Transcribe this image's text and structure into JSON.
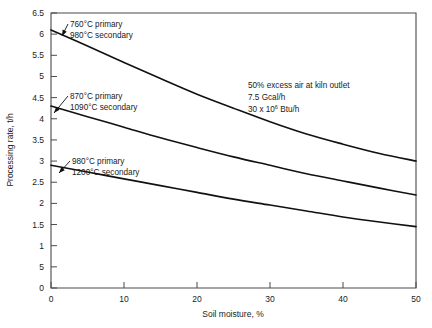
{
  "chart_data": {
    "type": "line",
    "title": "",
    "xlabel": "Soil moisture, %",
    "ylabel": "Processing rate, t/h",
    "xlim": [
      0,
      50
    ],
    "ylim": [
      0,
      6.5
    ],
    "grid": false,
    "legend_position": "inline-annotations",
    "xticks": [
      0,
      10,
      20,
      30,
      40,
      50
    ],
    "xtick_labels": [
      "0",
      "10",
      "20",
      "30",
      "40",
      "50"
    ],
    "yticks": [
      0,
      0.5,
      1,
      1.5,
      2,
      2.5,
      3,
      3.5,
      4,
      4.5,
      5,
      5.5,
      6,
      6.5
    ],
    "ytick_labels": [
      "0",
      "5",
      "1",
      "1.5",
      "2",
      "2.5",
      "3",
      "3.5",
      "4",
      "4.5",
      "5",
      "5.5",
      "6",
      "6.5"
    ],
    "x": [
      0,
      5,
      10,
      15,
      20,
      25,
      30,
      35,
      40,
      45,
      50
    ],
    "series": [
      {
        "name": "760°C primary / 980°C secondary",
        "values": [
          6.1,
          5.72,
          5.33,
          4.95,
          4.58,
          4.25,
          3.93,
          3.64,
          3.4,
          3.18,
          3.0
        ]
      },
      {
        "name": "870°C primary / 1090°C secondary",
        "values": [
          4.3,
          4.05,
          3.8,
          3.55,
          3.32,
          3.1,
          2.9,
          2.7,
          2.53,
          2.36,
          2.2
        ]
      },
      {
        "name": "980°C primary / 1200°C secondary",
        "values": [
          2.9,
          2.74,
          2.58,
          2.42,
          2.26,
          2.1,
          1.96,
          1.82,
          1.68,
          1.56,
          1.45
        ]
      }
    ],
    "annotations": [
      {
        "name": "curve-label-top",
        "line1": "760°C  primary",
        "line2": "980°C  secondary",
        "text_x": 70,
        "text_y": 27,
        "leader_from_x": 68,
        "leader_from_y": 24,
        "point_x": 62,
        "point_y": 36
      },
      {
        "name": "curve-label-middle",
        "line1": "870°C  primary",
        "line2": "1090°C  secondary",
        "text_x": 70,
        "text_y": 99,
        "leader_from_x": 68,
        "leader_from_y": 96,
        "point_x": 54,
        "point_y": 113
      },
      {
        "name": "curve-label-bottom",
        "line1": "980°C  primary",
        "line2": "1200°C  secondary",
        "text_x": 72,
        "text_y": 164,
        "leader_from_x": 70,
        "leader_from_y": 161,
        "point_x": 59,
        "point_y": 173
      }
    ],
    "note_block": {
      "name": "conditions-note",
      "line1": "50% excess air at kiln outlet",
      "line2": "7.5 Gcal/h",
      "line3_pre": "30 x 10",
      "line3_sup": "6",
      "line3_post": " Btu/h",
      "x": 248,
      "y": 88
    }
  }
}
